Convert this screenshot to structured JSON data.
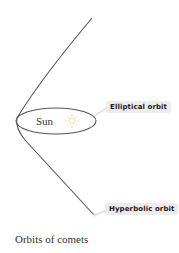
{
  "diagram": {
    "title": "Orbits of comets",
    "center_body": "Sun",
    "labels": {
      "elliptical": "Elliptical orbit",
      "hyperbolic": "Hyperbolic orbit"
    },
    "icons": [
      "sun-icon"
    ],
    "colors": {
      "line": "#555555",
      "label_bg": "#ececec",
      "sun_icon": "#f0e0b0"
    }
  }
}
